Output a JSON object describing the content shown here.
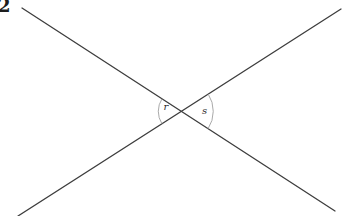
{
  "figure": {
    "problem_number": "2",
    "background_color": "#ffffff",
    "line_color": "#3d3d3d",
    "line_width": "1.3",
    "arc_color": "#9f9f9f",
    "arc_width": "0.9",
    "label_color": "#2a2a2a",
    "lines": [
      {
        "name": "line-1",
        "x1": "22",
        "y1": "8",
        "x2": "335",
        "y2": "211"
      },
      {
        "name": "line-2",
        "x1": "18",
        "y1": "216",
        "x2": "341",
        "y2": "9"
      }
    ],
    "vertex": {
      "x": "181.3",
      "y": "111.3"
    },
    "angles": [
      {
        "label": "r",
        "label_x": "166",
        "label_y": "109.5",
        "arc_path": "M 162.0 98.8 A 23 23 0 0 0 161.9 123.7"
      },
      {
        "label": "s",
        "label_x": "204.5",
        "label_y": "113.5",
        "arc_path": "M 208.2 94.0 A 32 32 0 0 1 208.1 128.7"
      }
    ]
  }
}
